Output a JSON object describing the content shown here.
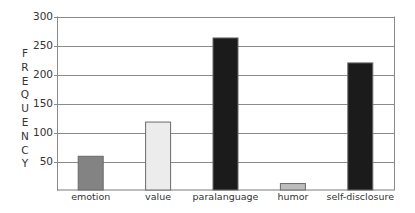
{
  "chart_data": {
    "type": "bar",
    "title": "",
    "xlabel": "",
    "ylabel": "FREQUENCY",
    "categories": [
      "emotion",
      "value",
      "paralanguage",
      "humor",
      "self-disclosure"
    ],
    "values": [
      59,
      118,
      263,
      12,
      220
    ],
    "bar_colors": [
      "#838383",
      "#ececec",
      "#1b1b1b",
      "#bdbdbd",
      "#1b1b1b"
    ],
    "ylim": [
      0,
      300
    ],
    "yticks": [
      50,
      100,
      150,
      200,
      250,
      300
    ],
    "grid": true,
    "legend": null
  }
}
